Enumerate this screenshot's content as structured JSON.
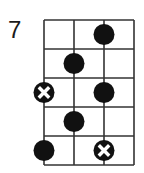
{
  "diagram": {
    "type": "fretboard-scale-diagram",
    "start_fret_label": "7",
    "strings": 4,
    "frets": 5,
    "colors": {
      "line": "#333333",
      "dot": "#111111",
      "root_mark": "#ffffff",
      "background": "#ffffff"
    },
    "notes": [
      {
        "fret": 1,
        "string": 3,
        "type": "dot"
      },
      {
        "fret": 2,
        "string": 2,
        "type": "dot"
      },
      {
        "fret": 3,
        "string": 1,
        "type": "root-x"
      },
      {
        "fret": 3,
        "string": 3,
        "type": "dot"
      },
      {
        "fret": 4,
        "string": 2,
        "type": "dot"
      },
      {
        "fret": 5,
        "string": 1,
        "type": "dot"
      },
      {
        "fret": 5,
        "string": 3,
        "type": "root-x"
      }
    ]
  }
}
